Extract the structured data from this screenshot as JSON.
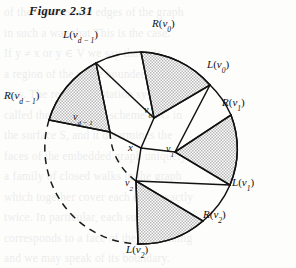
{
  "figure": {
    "title": "Figure 2.31",
    "caption_number": "2.31"
  },
  "geometry": {
    "center": {
      "x": 141,
      "y": 148
    },
    "outer_radius": 96,
    "inner_dashed_radius_outer": 96,
    "inner_dashed_radius_inner": 62,
    "center_label": "x"
  },
  "vertices": [
    {
      "id": "v0",
      "label_text": "v",
      "label_sub": "0",
      "label_x": 150,
      "label_y": 110,
      "angle_deg": 68,
      "inner_radius": 40
    },
    {
      "id": "v1",
      "label_text": "v",
      "label_sub": "1",
      "label_x": 171,
      "label_y": 148,
      "angle_deg": 4,
      "inner_radius": 45
    },
    {
      "id": "v2",
      "label_text": "v",
      "label_sub": "2",
      "label_x": 132,
      "label_y": 187,
      "angle_deg": -68,
      "inner_radius": 44
    },
    {
      "id": "vd1",
      "label_text": "v",
      "label_sub": "d − 1",
      "label_x": 82,
      "label_y": 117,
      "angle_deg": 128,
      "inner_radius": 48
    }
  ],
  "boundary_labels": [
    {
      "id": "Rv0",
      "prefix": "R",
      "arg": "v",
      "sub": "0",
      "x": 156,
      "y": 25,
      "anchor": "left"
    },
    {
      "id": "Lv0",
      "prefix": "L",
      "arg": "v",
      "sub": "0",
      "x": 239,
      "y": 65,
      "anchor": "left"
    },
    {
      "id": "Rv1",
      "prefix": "R",
      "arg": "v",
      "sub": "1",
      "x": 251,
      "y": 103,
      "anchor": "left"
    },
    {
      "id": "Lv1",
      "prefix": "L",
      "arg": "v",
      "sub": "1",
      "x": 235,
      "y": 182,
      "anchor": "left"
    },
    {
      "id": "Rv2",
      "prefix": "R",
      "arg": "v",
      "sub": "2",
      "x": 214,
      "y": 215,
      "anchor": "left"
    },
    {
      "id": "Lv2",
      "prefix": "L",
      "arg": "v",
      "sub": "2",
      "x": 133,
      "y": 248,
      "anchor": "left"
    },
    {
      "id": "Rvd1",
      "prefix": "R",
      "arg": "v",
      "sub": "d − 1",
      "x": 8,
      "y": 96,
      "anchor": "left"
    },
    {
      "id": "Lvd1",
      "prefix": "L",
      "arg": "v",
      "sub": "d − 1",
      "x": 69,
      "y": 33,
      "anchor": "left"
    }
  ],
  "colors": {
    "ink": "#121212",
    "shade_fill": "#c9c9c9",
    "paper": "#fdfdfc",
    "dash": "#1a1a1a"
  },
  "bleed_text": {
    "lines": [
      "of  the  vertices  and  edges  of  the  graph",
      "in  such  a  way  that  This  is  the  case.",
      "If  y  ≠  x  or  y  ∈  V  we  say  that  y  is",
      "a  region  of  the  plane  bounded  by  the",
      "arcs.  The  resulting  rotation  system  is",
      "called  the  embedding  scheme  of  G  in",
      "the  surface  S,  and  it  determines  the",
      "faces  of  the  embedded  graph  uniquely.",
      "a  family  of  closed  walks  in  the  graph",
      "which  together  cover  each  edge  exactly",
      "twice.  In  particular,  each  such  walk",
      "corresponds  to  a  face  of  the  embedding",
      "and  we  may  speak  of  its  boundary."
    ]
  }
}
